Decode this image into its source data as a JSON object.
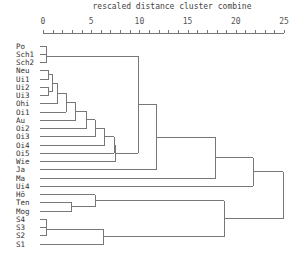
{
  "chart_data": {
    "type": "dendrogram",
    "title": "rescaled distance cluster combine",
    "xlabel": "rescaled distance cluster combine",
    "xlim": [
      0,
      25
    ],
    "x_ticks": [
      0,
      5,
      10,
      15,
      20,
      25
    ],
    "minor_tick_step": 1,
    "leaves": [
      "Po",
      "Sch1",
      "Sch2",
      "Neu",
      "Ui1",
      "Ui2",
      "Ui3",
      "Ohi",
      "Oi1",
      "Au",
      "Oi2",
      "Oi3",
      "Oi4",
      "Oi5",
      "Wie",
      "Ja",
      "Ma",
      "Ui4",
      "Hö",
      "Ten",
      "Mog",
      "S4",
      "S3",
      "S2",
      "S1"
    ],
    "merges": [
      {
        "id": "A",
        "children": [
          "Po",
          "Sch1"
        ],
        "distance": 0.4
      },
      {
        "id": "B",
        "children": [
          "A",
          "Sch2"
        ],
        "distance": 0.4
      },
      {
        "id": "C",
        "children": [
          "Neu",
          "Ui1"
        ],
        "distance": 0.6
      },
      {
        "id": "D",
        "children": [
          "Ui2",
          "Ui3"
        ],
        "distance": 0.6
      },
      {
        "id": "E",
        "children": [
          "C",
          "D"
        ],
        "distance": 1.0
      },
      {
        "id": "F",
        "children": [
          "E",
          "Ohi"
        ],
        "distance": 1.5
      },
      {
        "id": "G",
        "children": [
          "F",
          "Oi1"
        ],
        "distance": 2.4
      },
      {
        "id": "H",
        "children": [
          "G",
          "Au"
        ],
        "distance": 3.4
      },
      {
        "id": "I",
        "children": [
          "H",
          "Oi2"
        ],
        "distance": 4.5
      },
      {
        "id": "J",
        "children": [
          "I",
          "Oi3"
        ],
        "distance": 5.4
      },
      {
        "id": "K",
        "children": [
          "J",
          "Oi4"
        ],
        "distance": 6.4
      },
      {
        "id": "L",
        "children": [
          "K",
          "Oi5"
        ],
        "distance": 7.4
      },
      {
        "id": "M",
        "children": [
          "L",
          "Wie"
        ],
        "distance": 7.5
      },
      {
        "id": "N",
        "children": [
          "B",
          "M"
        ],
        "distance": 9.9
      },
      {
        "id": "O",
        "children": [
          "N",
          "Ja"
        ],
        "distance": 11.8
      },
      {
        "id": "P",
        "children": [
          "O",
          "Ma"
        ],
        "distance": 17.9
      },
      {
        "id": "Q",
        "children": [
          "P",
          "Ui4"
        ],
        "distance": 21.8
      },
      {
        "id": "R",
        "children": [
          "Ten",
          "Mog"
        ],
        "distance": 3.0
      },
      {
        "id": "S",
        "children": [
          "Hö",
          "R"
        ],
        "distance": 5.4
      },
      {
        "id": "T",
        "children": [
          "S4",
          "S3"
        ],
        "distance": 0.4
      },
      {
        "id": "U",
        "children": [
          "T",
          "S2"
        ],
        "distance": 0.4
      },
      {
        "id": "V",
        "children": [
          "U",
          "S1"
        ],
        "distance": 6.3
      },
      {
        "id": "W",
        "children": [
          "S",
          "V"
        ],
        "distance": 18.8
      },
      {
        "id": "X",
        "children": [
          "Q",
          "W"
        ],
        "distance": 24.9
      }
    ],
    "grid": false
  },
  "layout": {
    "x0": 43,
    "x25": 284,
    "axis_y": 33,
    "row_y0": 46,
    "row_step": 8.25
  }
}
